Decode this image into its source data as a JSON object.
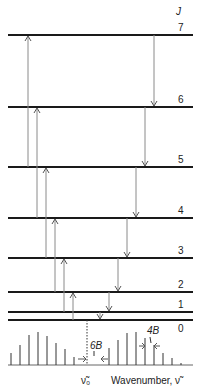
{
  "axis_symbol": "J",
  "levels": [
    {
      "J": "0",
      "y": 320
    },
    {
      "J": "1",
      "y": 312
    },
    {
      "J": "2",
      "y": 292
    },
    {
      "J": "3",
      "y": 258
    },
    {
      "J": "4",
      "y": 218
    },
    {
      "J": "5",
      "y": 167
    },
    {
      "J": "6",
      "y": 107
    },
    {
      "J": "7",
      "y": 35
    }
  ],
  "up_transitions": [
    {
      "x": 28,
      "from": "5",
      "to": "7"
    },
    {
      "x": 37,
      "from": "4",
      "to": "6"
    },
    {
      "x": 46,
      "from": "3",
      "to": "5"
    },
    {
      "x": 55,
      "from": "2",
      "to": "4"
    },
    {
      "x": 64,
      "from": "1",
      "to": "3"
    },
    {
      "x": 73,
      "from": "0",
      "to": "2"
    }
  ],
  "down_transitions": [
    {
      "x": 100,
      "from": "1",
      "to": "0"
    },
    {
      "x": 109,
      "from": "2",
      "to": "1"
    },
    {
      "x": 118,
      "from": "3",
      "to": "2"
    },
    {
      "x": 127,
      "from": "4",
      "to": "3"
    },
    {
      "x": 136,
      "from": "5",
      "to": "4"
    },
    {
      "x": 145,
      "from": "6",
      "to": "5"
    },
    {
      "x": 154,
      "from": "7",
      "to": "6"
    }
  ],
  "spectrum": {
    "baseline_y": 365,
    "p_branch": [
      {
        "x": 11,
        "h": 12
      },
      {
        "x": 20,
        "h": 20
      },
      {
        "x": 29,
        "h": 30
      },
      {
        "x": 38,
        "h": 33
      },
      {
        "x": 47,
        "h": 29
      },
      {
        "x": 56,
        "h": 22
      },
      {
        "x": 65,
        "h": 16
      },
      {
        "x": 74,
        "h": 8
      }
    ],
    "r_branch": [
      {
        "x": 109,
        "h": 17
      },
      {
        "x": 118,
        "h": 25
      },
      {
        "x": 127,
        "h": 32
      },
      {
        "x": 136,
        "h": 33
      },
      {
        "x": 145,
        "h": 27
      },
      {
        "x": 154,
        "h": 20
      },
      {
        "x": 163,
        "h": 12
      },
      {
        "x": 172,
        "h": 7
      },
      {
        "x": 181,
        "h": 2
      }
    ],
    "origin_x": 87,
    "origin_label": "ν̃₀",
    "gap_label": "6B",
    "spacing_label": "4B",
    "axis_label": "Wavenumber, ν̃"
  }
}
